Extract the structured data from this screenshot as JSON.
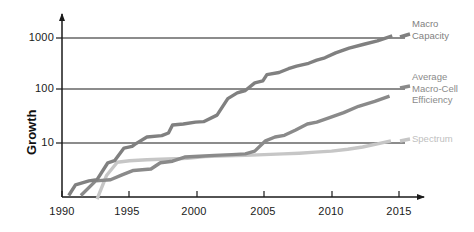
{
  "chart_data": {
    "type": "line",
    "title": "",
    "xlabel": "",
    "ylabel": "Growth",
    "xlim": [
      1990,
      2015
    ],
    "ylim": [
      1,
      3000
    ],
    "yscale": "log",
    "grid": true,
    "legend_position": "right",
    "ytick_labels": [
      "1000",
      "100",
      "10"
    ],
    "ytick_values": [
      1000,
      100,
      10
    ],
    "xtick_labels": [
      "1990",
      "1995",
      "2000",
      "2005",
      "2010",
      "2015"
    ],
    "xtick_values": [
      1990,
      1995,
      2000,
      2005,
      2010,
      2015
    ],
    "series": [
      {
        "name": "Macro Capacity",
        "color": "#808080",
        "legend_label": "Macro\nCapacity",
        "x": [
          1990.5,
          1991.0,
          1992.0,
          1992.6,
          1993.4,
          1993.9,
          1994.6,
          1995.2,
          1995.4,
          1996.3,
          1997.4,
          1997.9,
          1998.2,
          1999.0,
          1999.9,
          2000.5,
          2001.5,
          2002.3,
          2003.0,
          2003.6,
          2004.3,
          2004.9,
          2005.2,
          2006.1,
          2006.8,
          2007.4,
          2008.3,
          2008.9,
          2009.5,
          2010.3,
          2011.3,
          2012.4,
          2013.4,
          2014.5
        ],
        "y": [
          1.0,
          1.6,
          1.9,
          2.0,
          4.2,
          4.6,
          8.0,
          8.6,
          9.4,
          13.0,
          13.8,
          15.5,
          22.0,
          23.0,
          25.0,
          25.5,
          34.0,
          70.0,
          90.0,
          100.0,
          140.0,
          152.0,
          200.0,
          220.0,
          260.0,
          290.0,
          330.0,
          380.0,
          420.0,
          520.0,
          640.0,
          760.0,
          880.0,
          1100.0
        ]
      },
      {
        "name": "Average Macro-Cell Efficiency",
        "color": "#8a8a8a",
        "legend_label": "Average\nMacro-Cell\nEfficiency",
        "x": [
          1991.4,
          1992.5,
          1993.6,
          1994.5,
          1995.3,
          1996.6,
          1997.3,
          1998.2,
          1999.1,
          2000.2,
          2001.3,
          2002.6,
          2003.6,
          2004.3,
          2005.1,
          2005.8,
          2006.5,
          2007.3,
          2008.2,
          2008.9,
          2009.8,
          2010.9,
          2012.0,
          2013.2,
          2014.3
        ],
        "y": [
          1.0,
          1.9,
          2.0,
          2.5,
          3.0,
          3.2,
          4.2,
          4.5,
          5.4,
          5.6,
          5.8,
          6.0,
          6.2,
          7.0,
          11.0,
          13.0,
          14.0,
          17.5,
          23.0,
          25.0,
          30.0,
          38.0,
          50.0,
          62.0,
          78.0
        ]
      },
      {
        "name": "Spectrum",
        "color": "#c6c6c6",
        "legend_label": "Spectrum",
        "x": [
          1992.6,
          1993.3,
          1994.1,
          1995.0,
          1996.3,
          1997.3,
          1998.4,
          1999.3,
          2000.6,
          2002.2,
          2003.6,
          2005.0,
          2006.4,
          2007.6,
          2008.8,
          2010.0,
          2011.2,
          2012.3,
          2013.4,
          2014.4
        ],
        "y": [
          0.85,
          2.4,
          4.3,
          4.6,
          4.8,
          4.9,
          5.0,
          5.1,
          5.5,
          5.7,
          5.8,
          6.0,
          6.2,
          6.4,
          6.7,
          7.0,
          7.6,
          8.4,
          9.6,
          11.0
        ]
      }
    ]
  },
  "axis": {
    "ylabel": "Growth",
    "ytick_1000": "1000",
    "ytick_100": "100",
    "ytick_10": "10",
    "xtick_1990": "1990",
    "xtick_1995": "1995",
    "xtick_2000": "2000",
    "xtick_2005": "2005",
    "xtick_2010": "2010",
    "xtick_2015": "2015"
  },
  "legend": {
    "macro_capacity": "Macro\nCapacity",
    "macro_cell_efficiency": "Average\nMacro-Cell\nEfficiency",
    "spectrum": "Spectrum"
  }
}
